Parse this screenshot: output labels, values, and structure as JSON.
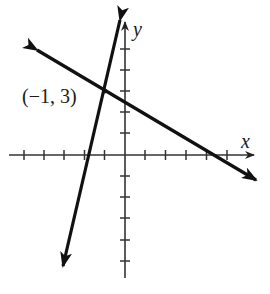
{
  "diagram": {
    "type": "coordinate-plane",
    "axes": {
      "x_label": "x",
      "y_label": "y",
      "x_ticks": [
        -5,
        -4,
        -3,
        -2,
        -1,
        1,
        2,
        3,
        4,
        5
      ],
      "y_ticks": [
        -5,
        -4,
        -3,
        -2,
        -1,
        1,
        2,
        3,
        4,
        5
      ]
    },
    "lines": [
      {
        "name": "steep-line",
        "description": "steep line with positive slope through (-1, 3)"
      },
      {
        "name": "shallow-line",
        "description": "line with negative slope through (-1, 3)"
      }
    ],
    "intersection": {
      "x": -1,
      "y": 3,
      "label": "(−1, 3)"
    },
    "colors": {
      "ink": "#111111",
      "background": "#ffffff"
    }
  }
}
